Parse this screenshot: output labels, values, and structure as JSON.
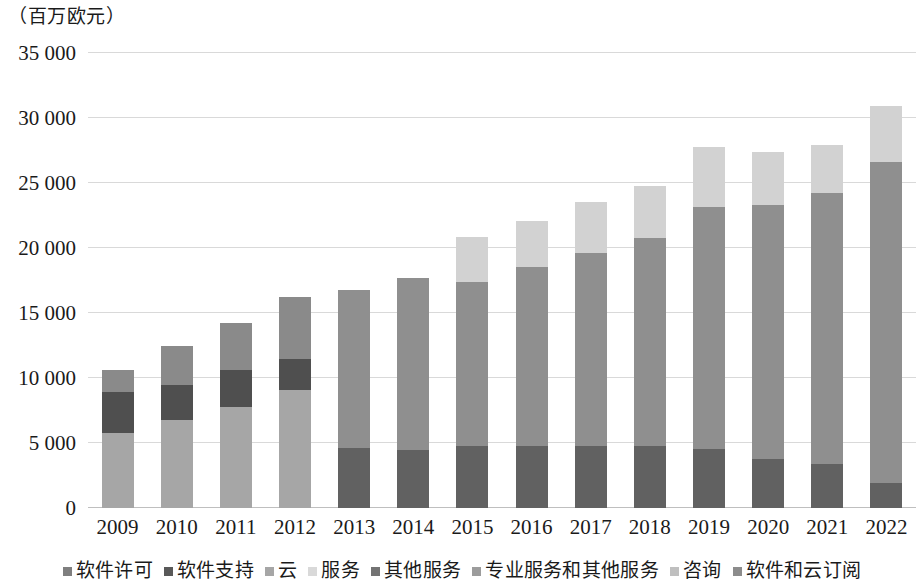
{
  "unit_caption": "（百万欧元）",
  "axis": {
    "y_ticks": [
      "35 000",
      "30 000",
      "25 000",
      "20 000",
      "15 000",
      "10 000",
      "5 000",
      "0"
    ],
    "x_ticks": [
      "2009",
      "2010",
      "2011",
      "2012",
      "2013",
      "2014",
      "2015",
      "2016",
      "2017",
      "2018",
      "2019",
      "2020",
      "2021",
      "2022"
    ]
  },
  "legend": {
    "items": [
      {
        "label": "软件许可",
        "color": "#7f7f7f"
      },
      {
        "label": "软件支持",
        "color": "#595959"
      },
      {
        "label": "云",
        "color": "#a6a6a6"
      },
      {
        "label": "服务",
        "color": "#d9d9d9"
      },
      {
        "label": "其他服务",
        "color": "#737373"
      },
      {
        "label": "专业服务和其他服务",
        "color": "#9c9c9c"
      },
      {
        "label": "咨询",
        "color": "#bfbfbf"
      },
      {
        "label": "软件和云订阅",
        "color": "#8c8c8c"
      }
    ]
  },
  "chart_data": {
    "type": "bar",
    "subtype": "stacked",
    "title": "",
    "subtitle": "",
    "xlabel": "",
    "ylabel": "（百万欧元）",
    "ylim": [
      0,
      35000
    ],
    "ytick_step": 5000,
    "grid": true,
    "legend_position": "bottom",
    "categories": [
      "2009",
      "2010",
      "2011",
      "2012",
      "2013",
      "2014",
      "2015",
      "2016",
      "2017",
      "2018",
      "2019",
      "2020",
      "2021",
      "2022"
    ],
    "series": [
      {
        "name": "软件许可",
        "color": "#7f7f7f",
        "values": [
          null,
          null,
          null,
          null,
          4600,
          4450,
          4800,
          4750,
          4800,
          4750,
          4550,
          3750,
          3350,
          1950
        ]
      },
      {
        "name": "软件支持",
        "color": "#595959",
        "values": [
          null,
          null,
          null,
          null,
          10300,
          11000,
          12550,
          13800,
          14800,
          16000,
          18600,
          19550,
          20850,
          24650
        ]
      },
      {
        "name": "云",
        "color": "#a6a6a6",
        "values": [
          5750,
          6750,
          7800,
          9050,
          null,
          null,
          null,
          null,
          null,
          null,
          null,
          null,
          null,
          null
        ]
      },
      {
        "name": "服务",
        "color": "#d9d9d9",
        "values": [
          null,
          null,
          null,
          null,
          null,
          null,
          3400,
          3600,
          3950,
          4050,
          4550,
          4050,
          3800,
          4400
        ]
      },
      {
        "name": "其他服务",
        "color": "#737373",
        "values": [
          3150,
          2750,
          2850,
          2400,
          null,
          null,
          null,
          null,
          null,
          null,
          null,
          null,
          null,
          null
        ]
      },
      {
        "name": "专业服务和其他服务",
        "color": "#9c9c9c",
        "values": [
          1750,
          2950,
          3600,
          4800,
          1900,
          2250,
          null,
          null,
          null,
          null,
          null,
          null,
          null,
          null
        ]
      },
      {
        "name": "咨询",
        "color": "#bfbfbf",
        "values": [
          null,
          null,
          null,
          null,
          null,
          null,
          null,
          null,
          null,
          null,
          null,
          null,
          null,
          null
        ]
      },
      {
        "name": "软件和云订阅",
        "color": "#8c8c8c",
        "values": [
          null,
          null,
          null,
          null,
          null,
          null,
          null,
          null,
          null,
          null,
          null,
          null,
          null,
          null
        ]
      }
    ],
    "stacks": [
      {
        "category": "2009",
        "total": 10650,
        "segments": [
          {
            "series": "云",
            "value": 5750,
            "color": "#a6a6a6"
          },
          {
            "series": "软件支持",
            "value": 3150,
            "color": "#4f4f4f"
          },
          {
            "series": "软件许可",
            "value": 1750,
            "color": "#8a8a8a"
          }
        ]
      },
      {
        "category": "2010",
        "total": 12450,
        "segments": [
          {
            "series": "云",
            "value": 6750,
            "color": "#a6a6a6"
          },
          {
            "series": "软件支持",
            "value": 2750,
            "color": "#4f4f4f"
          },
          {
            "series": "软件许可",
            "value": 2950,
            "color": "#8a8a8a"
          }
        ]
      },
      {
        "category": "2011",
        "total": 14250,
        "segments": [
          {
            "series": "云",
            "value": 7800,
            "color": "#a6a6a6"
          },
          {
            "series": "软件支持",
            "value": 2850,
            "color": "#4f4f4f"
          },
          {
            "series": "软件许可",
            "value": 3600,
            "color": "#8a8a8a"
          }
        ]
      },
      {
        "category": "2012",
        "total": 16250,
        "segments": [
          {
            "series": "云",
            "value": 9050,
            "color": "#a6a6a6"
          },
          {
            "series": "软件支持",
            "value": 2400,
            "color": "#4f4f4f"
          },
          {
            "series": "软件许可",
            "value": 4800,
            "color": "#8a8a8a"
          }
        ]
      },
      {
        "category": "2013",
        "total": 16800,
        "segments": [
          {
            "series": "软件许可",
            "value": 4600,
            "color": "#616161"
          },
          {
            "series": "软件支持",
            "value": 12200,
            "color": "#8f8f8f"
          }
        ]
      },
      {
        "category": "2014",
        "total": 17700,
        "segments": [
          {
            "series": "软件许可",
            "value": 4450,
            "color": "#616161"
          },
          {
            "series": "软件支持",
            "value": 13250,
            "color": "#8f8f8f"
          }
        ]
      },
      {
        "category": "2015",
        "total": 20850,
        "segments": [
          {
            "series": "软件许可",
            "value": 4800,
            "color": "#616161"
          },
          {
            "series": "软件支持",
            "value": 12550,
            "color": "#8f8f8f"
          },
          {
            "series": "服务",
            "value": 3500,
            "color": "#d2d2d2"
          }
        ]
      },
      {
        "category": "2016",
        "total": 22100,
        "segments": [
          {
            "series": "软件许可",
            "value": 4750,
            "color": "#616161"
          },
          {
            "series": "软件支持",
            "value": 13800,
            "color": "#8f8f8f"
          },
          {
            "series": "服务",
            "value": 3550,
            "color": "#d2d2d2"
          }
        ]
      },
      {
        "category": "2017",
        "total": 23550,
        "segments": [
          {
            "series": "软件许可",
            "value": 4800,
            "color": "#616161"
          },
          {
            "series": "软件支持",
            "value": 14800,
            "color": "#8f8f8f"
          },
          {
            "series": "服务",
            "value": 3950,
            "color": "#d2d2d2"
          }
        ]
      },
      {
        "category": "2018",
        "total": 24800,
        "segments": [
          {
            "series": "软件许可",
            "value": 4750,
            "color": "#616161"
          },
          {
            "series": "软件支持",
            "value": 16000,
            "color": "#8f8f8f"
          },
          {
            "series": "服务",
            "value": 4050,
            "color": "#d2d2d2"
          }
        ]
      },
      {
        "category": "2019",
        "total": 27750,
        "segments": [
          {
            "series": "软件许可",
            "value": 4550,
            "color": "#616161"
          },
          {
            "series": "软件支持",
            "value": 18600,
            "color": "#8f8f8f"
          },
          {
            "series": "服务",
            "value": 4600,
            "color": "#d2d2d2"
          }
        ]
      },
      {
        "category": "2020",
        "total": 27350,
        "segments": [
          {
            "series": "软件许可",
            "value": 3750,
            "color": "#616161"
          },
          {
            "series": "软件支持",
            "value": 19550,
            "color": "#8f8f8f"
          },
          {
            "series": "服务",
            "value": 4050,
            "color": "#d2d2d2"
          }
        ]
      },
      {
        "category": "2021",
        "total": 27950,
        "segments": [
          {
            "series": "软件许可",
            "value": 3350,
            "color": "#616161"
          },
          {
            "series": "软件支持",
            "value": 20850,
            "color": "#8f8f8f"
          },
          {
            "series": "服务",
            "value": 3750,
            "color": "#d2d2d2"
          }
        ]
      },
      {
        "category": "2022",
        "total": 30950,
        "segments": [
          {
            "series": "软件许可",
            "value": 1950,
            "color": "#616161"
          },
          {
            "series": "软件支持",
            "value": 24650,
            "color": "#8f8f8f"
          },
          {
            "series": "服务",
            "value": 4350,
            "color": "#d2d2d2"
          }
        ]
      }
    ]
  }
}
